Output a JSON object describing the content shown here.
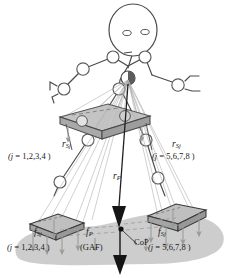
{
  "figure": {
    "background_color": "#ffffff",
    "ink_color": "#3a3a3a",
    "ground_shadow_color": "#c9c9c9",
    "platform_fill_color": "#bdbdbd",
    "arrow_color": "#8a8a8a"
  },
  "labels": {
    "r_left": {
      "symbol": "r",
      "subscript": "Sj",
      "index_text": "( j = 1,2,3,4 )"
    },
    "r_right": {
      "symbol": "r",
      "subscript": "Sj",
      "index_text": "( j = 5,6,7,8 )"
    },
    "r_p": {
      "symbol": "r",
      "subscript": "P"
    },
    "f_left": {
      "symbol": "f",
      "subscript": "Sj",
      "index_text": "( j = 1,2,3,4 )"
    },
    "f_right": {
      "symbol": "f",
      "subscript": "Sj",
      "index_text": "( j = 5,6,7,8 )"
    },
    "f_p": {
      "symbol": "f",
      "subscript": "P",
      "index_text": "(GAF)"
    },
    "cop": {
      "text": "CoP"
    }
  },
  "elements": {
    "head": "head-ellipse",
    "eyes": "eye-circles",
    "hip": "hip-joint-half-filled",
    "upper_platform": "hand-force-platform",
    "left_foot_platform": "left-foot-force-platform",
    "right_foot_platform": "right-foot-force-platform",
    "ground": "ground-shadow-blob",
    "cop_marker": "cop-point-marker"
  }
}
